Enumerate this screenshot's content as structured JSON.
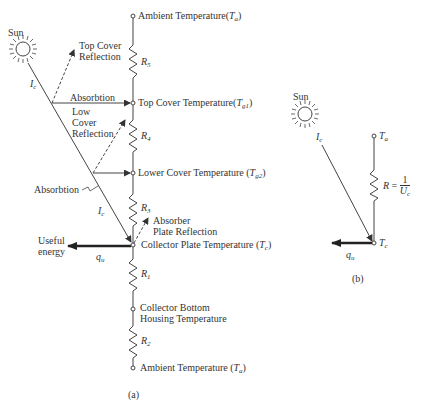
{
  "diagram_a": {
    "caption": "(a)",
    "sun_label": "Sun",
    "incident_label": "I",
    "incident_sub": "c",
    "incident_label_2": "I",
    "incident_sub_2": "c",
    "top_cover_reflection": [
      "Top Cover",
      "Reflection"
    ],
    "absorbtion_top": "Absorbtion",
    "low_cover_reflection": [
      "Low",
      "Cover",
      "Reflection"
    ],
    "absorbtion_low": "Absorbtion",
    "absorber_plate_reflection": [
      "Absorber",
      "Plate Reflection"
    ],
    "useful_energy": [
      "Useful",
      "energy"
    ],
    "heat_flow_label": "q",
    "heat_flow_sub": "u",
    "nodes": [
      {
        "label": "Ambient Temperature",
        "symbol": "T",
        "sub": "a"
      },
      {
        "label": "Top Cover Temperature",
        "symbol": "T",
        "sub": "g1"
      },
      {
        "label": "Lower Cover Temperature",
        "symbol": "T",
        "sub": "g2"
      },
      {
        "label": "Collector Plate Temperature",
        "symbol": "T",
        "sub": "c"
      },
      {
        "label": "Collector Bottom Housing Temperature",
        "lines": [
          "Collector Bottom",
          "Housing Temperature"
        ]
      },
      {
        "label": "Ambient Temperature",
        "symbol": "T",
        "sub": "a"
      }
    ],
    "resistors": [
      {
        "symbol": "R",
        "sub": "5"
      },
      {
        "symbol": "R",
        "sub": "4"
      },
      {
        "symbol": "R",
        "sub": "3"
      },
      {
        "symbol": "R",
        "sub": "1"
      },
      {
        "symbol": "R",
        "sub": "2"
      }
    ]
  },
  "diagram_b": {
    "caption": "(b)",
    "sun_label": "Sun",
    "incident_label": "I",
    "incident_sub": "c",
    "top_node": {
      "symbol": "T",
      "sub": "a"
    },
    "bottom_node": {
      "symbol": "T",
      "sub": "c"
    },
    "resistor": {
      "symbol": "R",
      "equals": "=",
      "numerator": "1",
      "denominator": "U",
      "denominator_sub": "c"
    },
    "heat_flow_label": "q",
    "heat_flow_sub": "u"
  }
}
